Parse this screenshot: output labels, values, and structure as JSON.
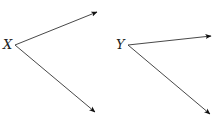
{
  "diagram": {
    "type": "angle-pair",
    "colors": {
      "line": "#333333",
      "arrowhead": "#111111",
      "label": "#222222",
      "background": "#ffffff"
    },
    "angles": [
      {
        "label": "X",
        "vertex": [
          15,
          45
        ],
        "rays": [
          {
            "name": "upper",
            "end": [
              97,
              12
            ]
          },
          {
            "name": "lower",
            "end": [
              95,
              112
            ]
          }
        ]
      },
      {
        "label": "Y",
        "vertex": [
          128,
          45
        ],
        "rays": [
          {
            "name": "upper",
            "end": [
              211,
              36
            ]
          },
          {
            "name": "lower",
            "end": [
              210,
              114
            ]
          }
        ]
      }
    ]
  }
}
